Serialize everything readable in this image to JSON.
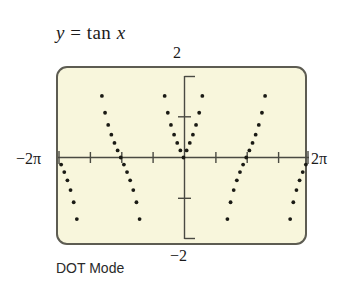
{
  "title": {
    "lhs": "y",
    "equals": " = ",
    "func": "tan ",
    "var": "x",
    "full": "y = tan x"
  },
  "caption": "DOT Mode",
  "axis_labels": {
    "top": "2",
    "bottom": "−2",
    "left": "−2π",
    "right": "2π"
  },
  "colors": {
    "screen_background": "#f8f6dc",
    "screen_border": "#5d5c52",
    "axis": "#4a4a42",
    "dot": "#1a1a14",
    "text": "#1b1b1b"
  },
  "chart_data": {
    "type": "scatter",
    "title": "y = tan x",
    "subtitle": "DOT Mode",
    "function": "y = tan(x)",
    "xlabel": "",
    "ylabel": "",
    "xlim": [
      -6.283185307,
      6.283185307
    ],
    "ylim": [
      -2,
      2
    ],
    "xtick_labels": [
      "−2π",
      "2π"
    ],
    "ytick_labels": [
      "2",
      "−2"
    ],
    "xticks": [
      -6.283185307,
      -4.71238898,
      -3.141592654,
      -1.570796327,
      0,
      1.570796327,
      3.141592654,
      4.71238898,
      6.283185307
    ],
    "yticks": [
      -2,
      -1,
      1,
      2
    ],
    "xtick_step_label": "π/2",
    "ytick_step_label": "1",
    "grid": false,
    "legend": null,
    "asymptotes": [
      -4.71238898,
      -1.570796327,
      1.570796327,
      4.71238898
    ],
    "render_mode": "dot",
    "dot_sample_count_per_branch": 13,
    "branches": [
      {
        "name": "branch-left-outer",
        "center": -6.283185307,
        "x": [
          -6.2832,
          -6.1261,
          -5.969,
          -5.8119,
          -5.6549,
          -5.4978,
          -5.3407,
          -5.1836,
          -5.0265,
          -4.8695
        ],
        "y": [
          0.0,
          -0.158,
          -0.325,
          -0.51,
          -0.727,
          -1.0,
          -1.376,
          -1.963,
          -3.078,
          -6.314
        ]
      },
      {
        "name": "branch-left-mid",
        "center": -3.141592654,
        "x": [
          -4.5553,
          -4.3982,
          -4.2412,
          -4.0841,
          -3.927,
          -3.7699,
          -3.6128,
          -3.4558,
          -3.2987,
          -3.1416,
          -2.9845,
          -2.8274,
          -2.6704,
          -2.5133,
          -2.3562,
          -2.1991,
          -2.042,
          -1.885,
          -1.7279
        ],
        "y": [
          6.314,
          3.078,
          1.963,
          1.376,
          1.0,
          0.727,
          0.51,
          0.325,
          0.158,
          0.0,
          -0.158,
          -0.325,
          -0.51,
          -0.727,
          -1.0,
          -1.376,
          -1.963,
          -3.078,
          -6.314
        ]
      },
      {
        "name": "branch-center",
        "center": 0,
        "x": [
          -1.4137,
          -1.2566,
          -1.0996,
          -0.9425,
          -0.7854,
          -0.6283,
          -0.4712,
          -0.3142,
          -0.1571,
          0.0,
          0.1571,
          0.3142,
          0.4712,
          0.6283,
          0.7854,
          0.9425,
          1.0996,
          1.2566,
          1.4137
        ],
        "y": [
          6.314,
          3.078,
          1.963,
          1.376,
          1.0,
          0.727,
          0.51,
          0.325,
          0.158,
          0.0,
          0.158,
          0.325,
          0.51,
          0.727,
          1.0,
          1.376,
          1.963,
          3.078,
          6.314
        ]
      },
      {
        "name": "branch-right-mid",
        "center": 3.141592654,
        "x": [
          1.7279,
          1.885,
          2.042,
          2.1991,
          2.3562,
          2.5133,
          2.6704,
          2.8274,
          2.9845,
          3.1416,
          3.2987,
          3.4558,
          3.6128,
          3.7699,
          3.927,
          4.0841,
          4.2412,
          4.3982,
          4.5553
        ],
        "y": [
          -6.314,
          -3.078,
          -1.963,
          -1.376,
          -1.0,
          -0.727,
          -0.51,
          -0.325,
          -0.158,
          0.0,
          0.158,
          0.325,
          0.51,
          0.727,
          1.0,
          1.376,
          1.963,
          3.078,
          6.314
        ]
      },
      {
        "name": "branch-right-outer",
        "center": 6.283185307,
        "x": [
          4.8695,
          5.0265,
          5.1836,
          5.3407,
          5.4978,
          5.6549,
          5.8119,
          5.969,
          6.1261,
          6.2832
        ],
        "y": [
          -6.314,
          -3.078,
          -1.963,
          -1.376,
          -1.0,
          -0.727,
          -0.51,
          -0.325,
          -0.158,
          0.0
        ]
      }
    ]
  }
}
